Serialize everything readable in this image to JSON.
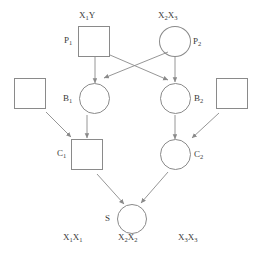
{
  "diagram": {
    "stroke_color": "#8a8a8a",
    "text_color": "#3a3a3a",
    "background": "#ffffff",
    "nodes": [
      {
        "id": "P1",
        "label": "P",
        "sub": "1",
        "shape": "square",
        "genotype": "X",
        "genotype_sub": "1",
        "genotype_tail": "Y"
      },
      {
        "id": "P2",
        "label": "P",
        "sub": "2",
        "shape": "circle",
        "genotype": "X",
        "genotype_sub": "2",
        "genotype_tail": "X",
        "genotype_tail_sub": "3"
      },
      {
        "id": "B1",
        "label": "B",
        "sub": "1",
        "shape": "circle"
      },
      {
        "id": "B2",
        "label": "B",
        "sub": "2",
        "shape": "circle"
      },
      {
        "id": "M1",
        "label": "",
        "shape": "square"
      },
      {
        "id": "M2",
        "label": "",
        "shape": "square"
      },
      {
        "id": "C1",
        "label": "C",
        "sub": "1",
        "shape": "square"
      },
      {
        "id": "C2",
        "label": "C",
        "sub": "2",
        "shape": "circle"
      },
      {
        "id": "S",
        "label": "S",
        "sub": "",
        "shape": "circle"
      }
    ],
    "bottom_genotypes": [
      {
        "id": "geno-left",
        "base": "X",
        "sub1": "1",
        "base2": "X",
        "sub2": "1"
      },
      {
        "id": "geno-mid",
        "base": "X",
        "sub1": "2",
        "base2": "X",
        "sub2": "2"
      },
      {
        "id": "geno-right",
        "base": "X",
        "sub1": "3",
        "base2": "X",
        "sub2": "3"
      }
    ],
    "edges": [
      {
        "from": "P1",
        "to": "B1"
      },
      {
        "from": "P1",
        "to": "B2"
      },
      {
        "from": "P2",
        "to": "B1"
      },
      {
        "from": "P2",
        "to": "B2"
      },
      {
        "from": "M1",
        "to": "C1"
      },
      {
        "from": "B1",
        "to": "C1"
      },
      {
        "from": "B2",
        "to": "C2"
      },
      {
        "from": "M2",
        "to": "C2"
      },
      {
        "from": "C1",
        "to": "S"
      },
      {
        "from": "C2",
        "to": "S"
      }
    ]
  }
}
